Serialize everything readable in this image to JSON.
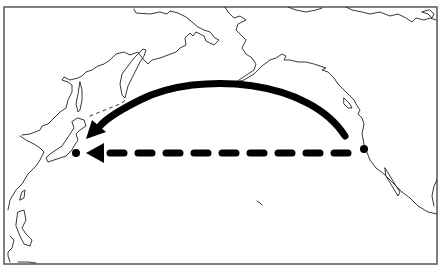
{
  "map": {
    "region": "North Pacific Ocean",
    "frame": {
      "x": 4,
      "y": 7,
      "width": 433,
      "height": 257,
      "stroke": "#555555"
    },
    "colors": {
      "land_outline": "#222222",
      "route": "#000000",
      "background": "#ffffff"
    },
    "endpoints": [
      {
        "name": "origin-north-america-west-coast",
        "x": 364,
        "y": 149
      },
      {
        "name": "destination-japan",
        "x": 76,
        "y": 153
      }
    ],
    "routes": [
      {
        "name": "great-circle-route",
        "style": "solid",
        "from": "origin-north-america-west-coast",
        "to": "destination-japan"
      },
      {
        "name": "straight-line-route",
        "style": "dashed",
        "from": "origin-north-america-west-coast",
        "to": "destination-japan"
      }
    ]
  }
}
